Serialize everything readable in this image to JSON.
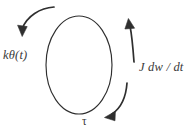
{
  "figure": {
    "background_color": "#ffffff",
    "stroke_color": "#2f2f2f",
    "text_color": "#3a3a3a"
  },
  "body": {
    "name": "rotational-inertia-ellipse",
    "shape": "ellipse",
    "center_x": 79,
    "center_y": 65,
    "radius_x": 33,
    "radius_y": 49
  },
  "labels": {
    "spring_torque": "kθ(t)",
    "inertia_torque": "J dw / dt",
    "applied_torque": "τ"
  },
  "arrows": [
    {
      "name": "spring-torque-arrow",
      "position": "top-left",
      "direction": "counterclockwise-down-left",
      "label": "kθ(t)"
    },
    {
      "name": "inertia-torque-arrow",
      "position": "right",
      "direction": "upward",
      "label": "J dw / dt"
    },
    {
      "name": "applied-torque-arrow",
      "position": "bottom-right",
      "direction": "down-left",
      "label": "τ"
    }
  ]
}
